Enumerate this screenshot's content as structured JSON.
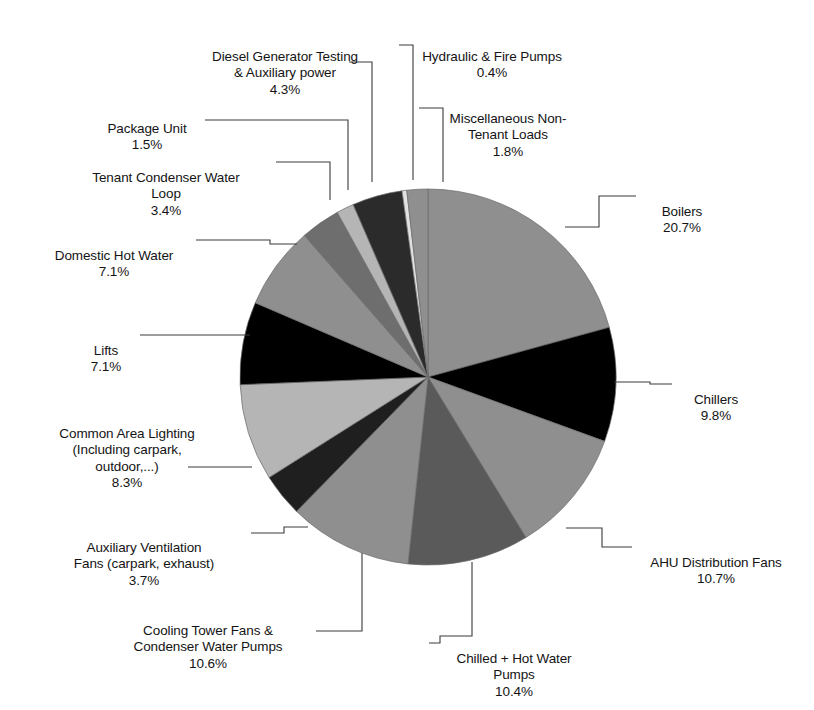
{
  "chart_data": {
    "type": "pie",
    "title": "",
    "subtitle": "",
    "xlabel": "",
    "ylabel": "",
    "legend_position": "none",
    "grid": false,
    "units": "percent",
    "total": 100.0,
    "start_angle_deg": 0,
    "direction": "clockwise",
    "categories": [
      "Boilers",
      "Chillers",
      "AHU Distribution Fans",
      "Chilled + Hot Water Pumps",
      "Cooling Tower Fans & Condenser Water Pumps",
      "Auxiliary Ventilation Fans (carpark, exhaust)",
      "Common Area Lighting (Including carpark, outdoor,...)",
      "Lifts",
      "Domestic Hot Water",
      "Tenant Condenser Water Loop",
      "Package Unit",
      "Diesel Generator Testing & Auxiliary power",
      "Hydraulic & Fire Pumps",
      "Miscellaneous Non-Tenant Loads"
    ],
    "values": [
      20.7,
      9.8,
      10.7,
      10.4,
      10.6,
      3.7,
      8.3,
      7.1,
      7.1,
      3.4,
      1.5,
      4.3,
      0.4,
      1.8
    ],
    "colors": [
      "#8f8f8f",
      "#000000",
      "#8f8f8f",
      "#5a5a5a",
      "#8f8f8f",
      "#1f1f1f",
      "#b5b5b5",
      "#000000",
      "#8f8f8f",
      "#6e6e6e",
      "#b5b5b5",
      "#2b2b2b",
      "#e2e2e2",
      "#8f8f8f"
    ],
    "slices": [
      {
        "label": "Boilers",
        "pct_text": "20.7%",
        "value": 20.7,
        "color": "#8f8f8f"
      },
      {
        "label": "Chillers",
        "pct_text": "9.8%",
        "value": 9.8,
        "color": "#000000"
      },
      {
        "label": "AHU Distribution Fans",
        "pct_text": "10.7%",
        "value": 10.7,
        "color": "#8f8f8f"
      },
      {
        "label": "Chilled + Hot Water Pumps",
        "pct_text": "10.4%",
        "value": 10.4,
        "color": "#5a5a5a"
      },
      {
        "label": "Cooling Tower Fans & Condenser Water Pumps",
        "pct_text": "10.6%",
        "value": 10.6,
        "color": "#8f8f8f"
      },
      {
        "label": "Auxiliary Ventilation Fans (carpark, exhaust)",
        "pct_text": "3.7%",
        "value": 3.7,
        "color": "#1f1f1f"
      },
      {
        "label": "Common Area Lighting (Including carpark, outdoor,...)",
        "pct_text": "8.3%",
        "value": 8.3,
        "color": "#b5b5b5"
      },
      {
        "label": "Lifts",
        "pct_text": "7.1%",
        "value": 7.1,
        "color": "#000000"
      },
      {
        "label": "Domestic Hot Water",
        "pct_text": "7.1%",
        "value": 7.1,
        "color": "#8f8f8f"
      },
      {
        "label": "Tenant Condenser Water Loop",
        "pct_text": "3.4%",
        "value": 3.4,
        "color": "#6e6e6e"
      },
      {
        "label": "Package Unit",
        "pct_text": "1.5%",
        "value": 1.5,
        "color": "#b5b5b5"
      },
      {
        "label": "Diesel Generator Testing & Auxiliary power",
        "pct_text": "4.3%",
        "value": 4.3,
        "color": "#2b2b2b"
      },
      {
        "label": "Hydraulic & Fire Pumps",
        "pct_text": "0.4%",
        "value": 0.4,
        "color": "#e2e2e2"
      },
      {
        "label": "Miscellaneous Non-Tenant Loads",
        "pct_text": "1.8%",
        "value": 1.8,
        "color": "#8f8f8f"
      }
    ]
  },
  "geometry": {
    "cx": 428,
    "cy": 377,
    "r": 188
  },
  "labels": {
    "boilers": {
      "name": "Boilers",
      "pct": "20.7%"
    },
    "chillers": {
      "name": "Chillers",
      "pct": "9.8%"
    },
    "ahu": {
      "name": "AHU Distribution Fans",
      "pct": "10.7%"
    },
    "chw_hw_pumps": {
      "name": "Chilled + Hot Water\nPumps",
      "pct": "10.4%"
    },
    "cooling_tower": {
      "name": "Cooling Tower Fans &\nCondenser Water Pumps",
      "pct": "10.6%"
    },
    "aux_vent": {
      "name": "Auxiliary Ventilation\nFans (carpark, exhaust)",
      "pct": "3.7%"
    },
    "common_light": {
      "name": "Common Area Lighting\n(Including carpark,\noutdoor,...)",
      "pct": "8.3%"
    },
    "lifts": {
      "name": "Lifts",
      "pct": "7.1%"
    },
    "dhw": {
      "name": "Domestic Hot Water",
      "pct": "7.1%"
    },
    "tenant_cw": {
      "name": "Tenant Condenser Water\nLoop",
      "pct": "3.4%"
    },
    "package_unit": {
      "name": "Package Unit",
      "pct": "1.5%"
    },
    "diesel_gen": {
      "name": "Diesel Generator Testing\n& Auxiliary power",
      "pct": "4.3%"
    },
    "hydraulic": {
      "name": "Hydraulic & Fire Pumps",
      "pct": "0.4%"
    },
    "misc": {
      "name": "Miscellaneous Non-\nTenant Loads",
      "pct": "1.8%"
    }
  }
}
